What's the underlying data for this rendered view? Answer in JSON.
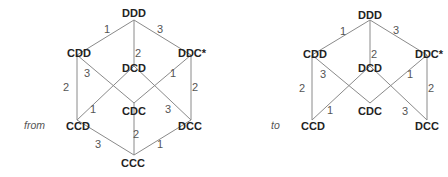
{
  "colors": {
    "edge": "#8a8a8a",
    "node_text": "#222222",
    "edge_label": "#555555",
    "background": "#ffffff"
  },
  "diagrams": [
    {
      "caption": "from",
      "caption_pos": [
        24,
        129
      ],
      "nodes": [
        {
          "id": "DDD",
          "label": "DDD",
          "x": 134,
          "y": 20,
          "lx": 134,
          "ly": 17
        },
        {
          "id": "CDD",
          "label": "CDD",
          "x": 77,
          "y": 55,
          "lx": 79,
          "ly": 57
        },
        {
          "id": "DDC",
          "label": "DDC*",
          "x": 191,
          "y": 55,
          "lx": 192,
          "ly": 57
        },
        {
          "id": "DCD",
          "label": "DCD",
          "x": 134,
          "y": 66,
          "lx": 134,
          "ly": 72
        },
        {
          "id": "CDC",
          "label": "CDC",
          "x": 134,
          "y": 103,
          "lx": 134,
          "ly": 115
        },
        {
          "id": "CCD",
          "label": "CCD",
          "x": 77,
          "y": 120,
          "lx": 78,
          "ly": 130
        },
        {
          "id": "DCC",
          "label": "DCC",
          "x": 191,
          "y": 120,
          "lx": 190,
          "ly": 130
        },
        {
          "id": "CCC",
          "label": "CCC",
          "x": 134,
          "y": 155,
          "lx": 133,
          "ly": 167
        }
      ],
      "edges": [
        {
          "from": "DDD",
          "to": "CDD",
          "label": "1",
          "lx": 107,
          "ly": 33
        },
        {
          "from": "DDD",
          "to": "DCD",
          "label": "2",
          "lx": 138,
          "ly": 57
        },
        {
          "from": "DDD",
          "to": "DDC",
          "label": "3",
          "lx": 160,
          "ly": 33
        },
        {
          "from": "CDD",
          "to": "CCD",
          "label": "2",
          "lx": 66,
          "ly": 91
        },
        {
          "from": "CDD",
          "to": "CDC",
          "label": "3",
          "lx": 87,
          "ly": 77
        },
        {
          "from": "DCD",
          "to": "CCD",
          "label": "1",
          "lx": 93,
          "ly": 113
        },
        {
          "from": "DCD",
          "to": "DCC",
          "label": "3",
          "lx": 168,
          "ly": 113
        },
        {
          "from": "DDC",
          "to": "CDC",
          "label": "1",
          "lx": 173,
          "ly": 77
        },
        {
          "from": "DDC",
          "to": "DCC",
          "label": "2",
          "lx": 195,
          "ly": 91
        },
        {
          "from": "CCD",
          "to": "CCC",
          "label": "3",
          "lx": 98,
          "ly": 148
        },
        {
          "from": "CDC",
          "to": "CCC",
          "label": "2",
          "lx": 136,
          "ly": 138
        },
        {
          "from": "DCC",
          "to": "CCC",
          "label": "1",
          "lx": 160,
          "ly": 148
        }
      ]
    },
    {
      "caption": "to",
      "caption_pos": [
        271,
        129
      ],
      "nodes": [
        {
          "id": "DDD",
          "label": "DDD",
          "x": 370,
          "y": 20,
          "lx": 370,
          "ly": 19
        },
        {
          "id": "CDD",
          "label": "CDD",
          "x": 312,
          "y": 55,
          "lx": 315,
          "ly": 58
        },
        {
          "id": "DDC",
          "label": "DDC*",
          "x": 427,
          "y": 55,
          "lx": 429,
          "ly": 58
        },
        {
          "id": "DCD",
          "label": "DCD",
          "x": 370,
          "y": 66,
          "lx": 370,
          "ly": 72
        },
        {
          "id": "CDC",
          "label": "CDC",
          "x": 370,
          "y": 103,
          "lx": 370,
          "ly": 115
        },
        {
          "id": "CCD",
          "label": "CCD",
          "x": 312,
          "y": 120,
          "lx": 313,
          "ly": 130
        },
        {
          "id": "DCC",
          "label": "DCC",
          "x": 427,
          "y": 120,
          "lx": 427,
          "ly": 130
        }
      ],
      "edges": [
        {
          "from": "DDD",
          "to": "CDD",
          "label": "1",
          "lx": 343,
          "ly": 35
        },
        {
          "from": "DDD",
          "to": "DCD",
          "label": "2",
          "lx": 374,
          "ly": 58
        },
        {
          "from": "DDD",
          "to": "DDC",
          "label": "3",
          "lx": 396,
          "ly": 34
        },
        {
          "from": "CDD",
          "to": "CCD",
          "label": "2",
          "lx": 302,
          "ly": 92
        },
        {
          "from": "CDD",
          "to": "CDC",
          "label": "3",
          "lx": 323,
          "ly": 78
        },
        {
          "from": "DCD",
          "to": "CCD",
          "label": "1",
          "lx": 330,
          "ly": 114
        },
        {
          "from": "DCD",
          "to": "DCC",
          "label": "3",
          "lx": 405,
          "ly": 115
        },
        {
          "from": "DDC",
          "to": "CDC",
          "label": "1",
          "lx": 410,
          "ly": 78
        },
        {
          "from": "DDC",
          "to": "DCC",
          "label": "2",
          "lx": 431,
          "ly": 92
        }
      ]
    }
  ]
}
